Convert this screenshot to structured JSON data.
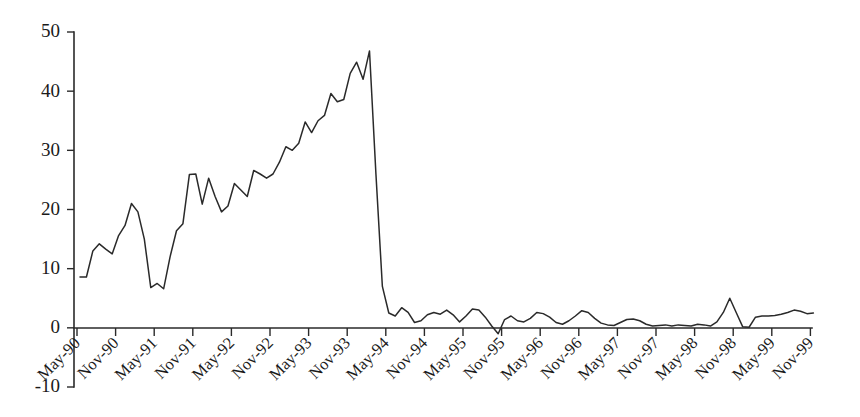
{
  "chart_data": {
    "type": "line",
    "title": "",
    "subtitle": "",
    "xlabel": "",
    "ylabel": "",
    "grid": false,
    "legend": "none",
    "legend_entries": [],
    "annotations": [],
    "line_color": "#2a2a2a",
    "axis_color": "#2a2a2a",
    "background_color": "#ffffff",
    "ylim": [
      -10,
      50
    ],
    "ytick_values": [
      50,
      40,
      30,
      20,
      10,
      0,
      -10
    ],
    "ytick_labels": [
      "50",
      "40",
      "30",
      "20",
      "10",
      "0",
      "-10"
    ],
    "xtick_labels": [
      "May-90",
      "Nov-90",
      "May-91",
      "Nov-91",
      "May-92",
      "Nov-92",
      "May-93",
      "Nov-93",
      "May-94",
      "Nov-94",
      "May-95",
      "Nov-95",
      "May-96",
      "Nov-96",
      "May-97",
      "Nov-97",
      "May-98",
      "Nov-98",
      "May-99",
      "Nov-99"
    ],
    "xtick_rotation_deg": 45,
    "x_categories": [
      "May-90",
      "Jun-90",
      "Jul-90",
      "Aug-90",
      "Sep-90",
      "Oct-90",
      "Nov-90",
      "Dec-90",
      "Jan-91",
      "Feb-91",
      "Mar-91",
      "Apr-91",
      "May-91",
      "Jun-91",
      "Jul-91",
      "Aug-91",
      "Sep-91",
      "Oct-91",
      "Nov-91",
      "Dec-91",
      "Jan-92",
      "Feb-92",
      "Mar-92",
      "Apr-92",
      "May-92",
      "Jun-92",
      "Jul-92",
      "Aug-92",
      "Sep-92",
      "Oct-92",
      "Nov-92",
      "Dec-92",
      "Jan-93",
      "Feb-93",
      "Mar-93",
      "Apr-93",
      "May-93",
      "Jun-93",
      "Jul-93",
      "Aug-93",
      "Sep-93",
      "Oct-93",
      "Nov-93",
      "Dec-93",
      "Jan-94",
      "Feb-94",
      "Mar-94",
      "Apr-94",
      "May-94",
      "Jun-94",
      "Jul-94",
      "Aug-94",
      "Sep-94",
      "Oct-94",
      "Nov-94",
      "Dec-94",
      "Jan-95",
      "Feb-95",
      "Mar-95",
      "Apr-95",
      "May-95",
      "Jun-95",
      "Jul-95",
      "Aug-95",
      "Sep-95",
      "Oct-95",
      "Nov-95",
      "Dec-95",
      "Jan-96",
      "Feb-96",
      "Mar-96",
      "Apr-96",
      "May-96",
      "Jun-96",
      "Jul-96",
      "Aug-96",
      "Sep-96",
      "Oct-96",
      "Nov-96",
      "Dec-96",
      "Jan-97",
      "Feb-97",
      "Mar-97",
      "Apr-97",
      "May-97",
      "Jun-97",
      "Jul-97",
      "Aug-97",
      "Sep-97",
      "Oct-97",
      "Nov-97",
      "Dec-97",
      "Jan-98",
      "Feb-98",
      "Mar-98",
      "Apr-98",
      "May-98",
      "Jun-98",
      "Jul-98",
      "Aug-98",
      "Sep-98",
      "Oct-98",
      "Nov-98",
      "Dec-98",
      "Jan-99",
      "Feb-99",
      "Mar-99",
      "Apr-99",
      "May-99",
      "Jun-99",
      "Jul-99",
      "Aug-99",
      "Sep-99",
      "Oct-99",
      "Nov-99"
    ],
    "values": [
      8.6,
      8.6,
      13.0,
      14.2,
      13.3,
      12.5,
      15.6,
      17.3,
      21.0,
      19.6,
      15.0,
      6.8,
      7.5,
      6.6,
      12.0,
      16.4,
      17.6,
      25.9,
      26.0,
      20.9,
      25.3,
      22.2,
      19.6,
      20.6,
      24.4,
      23.3,
      22.2,
      26.6,
      26.0,
      25.3,
      26.0,
      28.0,
      30.6,
      30.0,
      31.2,
      34.8,
      33.0,
      35.0,
      35.9,
      39.6,
      38.2,
      38.6,
      43.0,
      44.9,
      42.0,
      46.8,
      26.0,
      7.0,
      2.5,
      2.0,
      3.4,
      2.6,
      0.9,
      1.2,
      2.2,
      2.6,
      2.3,
      3.0,
      2.2,
      1.0,
      2.0,
      3.2,
      3.0,
      1.8,
      0.3,
      -1.0,
      1.4,
      2.0,
      1.2,
      1.0,
      1.6,
      2.6,
      2.4,
      1.8,
      0.9,
      0.6,
      1.2,
      2.0,
      2.9,
      2.6,
      1.6,
      0.8,
      0.5,
      0.4,
      0.9,
      1.4,
      1.5,
      1.2,
      0.6,
      0.3,
      0.4,
      0.5,
      0.3,
      0.5,
      0.4,
      0.3,
      0.6,
      0.5,
      0.3,
      1.0,
      2.6,
      5.0,
      2.6,
      0.2,
      0.1,
      1.8,
      2.0,
      2.0,
      2.1,
      2.3,
      2.6,
      3.0,
      2.8,
      2.4,
      2.5
    ]
  }
}
